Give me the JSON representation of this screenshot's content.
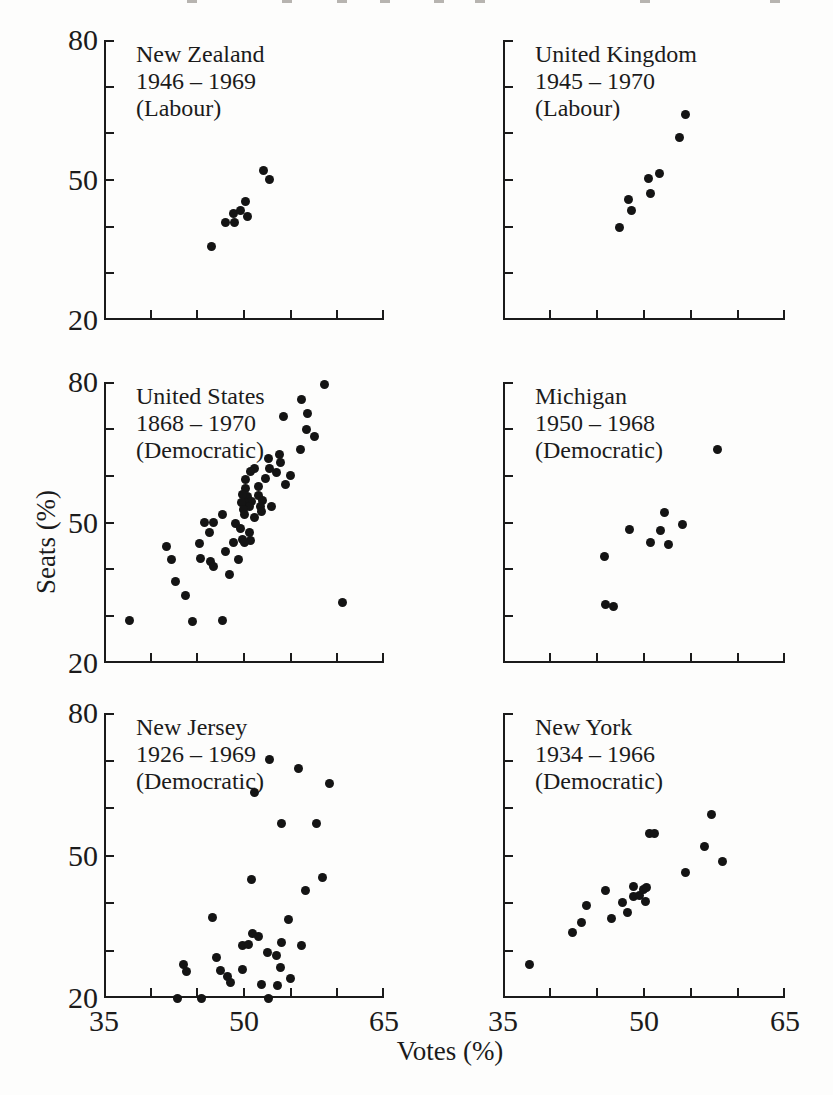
{
  "figure": {
    "xlabel": "Votes (%)",
    "ylabel": "Seats (%)",
    "ink_color": "#1b1b1b",
    "dot_color": "#141414",
    "background": "#fdfdfc",
    "scan_top_edge_marks_x": [
      187,
      282,
      337,
      380,
      434,
      475,
      640,
      770
    ]
  },
  "axes": {
    "xlim": [
      35,
      65
    ],
    "ylim": [
      20,
      80
    ],
    "xticks": [
      40,
      45,
      50,
      55,
      60,
      65
    ],
    "yticks": [
      30,
      40,
      50,
      60,
      70,
      80
    ],
    "xtick_labels": [
      {
        "value": 35,
        "label": "35"
      },
      {
        "value": 50,
        "label": "50"
      },
      {
        "value": 65,
        "label": "65"
      }
    ],
    "ytick_labels": [
      {
        "value": 80,
        "label": "80"
      },
      {
        "value": 50,
        "label": "50"
      },
      {
        "value": 20,
        "label": "20"
      }
    ]
  },
  "chart_data": [
    {
      "type": "scatter",
      "title_lines": [
        "New Zealand",
        "1946 – 1969",
        "(Labour)"
      ],
      "show_y_tick_labels": true,
      "show_x_tick_labels": false,
      "points": [
        [
          46.5,
          35.7
        ],
        [
          48.0,
          40.9
        ],
        [
          48.9,
          42.8
        ],
        [
          49.0,
          40.8
        ],
        [
          49.6,
          43.4
        ],
        [
          50.2,
          45.3
        ],
        [
          50.4,
          42.2
        ],
        [
          52.1,
          52.1
        ],
        [
          52.7,
          50.1
        ]
      ]
    },
    {
      "type": "scatter",
      "title_lines": [
        "United Kingdom",
        "1945 – 1970",
        "(Labour)"
      ],
      "show_y_tick_labels": false,
      "show_x_tick_labels": false,
      "points": [
        [
          47.4,
          39.9
        ],
        [
          48.4,
          45.9
        ],
        [
          48.7,
          43.4
        ],
        [
          50.5,
          50.3
        ],
        [
          50.7,
          47.1
        ],
        [
          51.7,
          51.5
        ],
        [
          53.8,
          59.2
        ],
        [
          54.4,
          64.1
        ]
      ]
    },
    {
      "type": "scatter",
      "title_lines": [
        "United States",
        "1868 – 1970",
        "(Democratic)"
      ],
      "show_y_tick_labels": true,
      "show_x_tick_labels": false,
      "points": [
        [
          58.6,
          79.4
        ],
        [
          56.2,
          76.2
        ],
        [
          56.8,
          73.2
        ],
        [
          54.2,
          72.7
        ],
        [
          56.7,
          69.8
        ],
        [
          57.6,
          68.4
        ],
        [
          56.0,
          65.5
        ],
        [
          53.8,
          64.5
        ],
        [
          53.9,
          62.8
        ],
        [
          52.6,
          63.6
        ],
        [
          52.7,
          61.6
        ],
        [
          53.5,
          60.6
        ],
        [
          51.1,
          61.6
        ],
        [
          52.3,
          59.5
        ],
        [
          54.4,
          58.1
        ],
        [
          55.0,
          60.0
        ],
        [
          50.2,
          59.1
        ],
        [
          50.7,
          60.9
        ],
        [
          51.5,
          57.7
        ],
        [
          51.6,
          55.8
        ],
        [
          50.2,
          57.2
        ],
        [
          50.4,
          55.6
        ],
        [
          49.8,
          55.9
        ],
        [
          50.8,
          54.5
        ],
        [
          50.1,
          54.2
        ],
        [
          50.6,
          53.5
        ],
        [
          49.7,
          54.3
        ],
        [
          49.9,
          52.7
        ],
        [
          52.0,
          54.7
        ],
        [
          51.8,
          53.5
        ],
        [
          51.9,
          52.4
        ],
        [
          52.9,
          53.5
        ],
        [
          50.1,
          51.7
        ],
        [
          51.1,
          51.0
        ],
        [
          47.7,
          51.7
        ],
        [
          45.8,
          49.9
        ],
        [
          46.7,
          49.9
        ],
        [
          46.3,
          47.9
        ],
        [
          49.1,
          49.7
        ],
        [
          49.6,
          48.7
        ],
        [
          49.8,
          46.3
        ],
        [
          50.6,
          47.8
        ],
        [
          50.7,
          46.2
        ],
        [
          50.0,
          45.8
        ],
        [
          48.9,
          45.8
        ],
        [
          45.2,
          45.6
        ],
        [
          41.7,
          44.9
        ],
        [
          42.2,
          42.1
        ],
        [
          45.3,
          42.4
        ],
        [
          48.0,
          43.8
        ],
        [
          46.4,
          41.6
        ],
        [
          49.4,
          42.1
        ],
        [
          46.7,
          40.6
        ],
        [
          48.4,
          38.9
        ],
        [
          42.7,
          37.4
        ],
        [
          43.7,
          34.4
        ],
        [
          60.5,
          33.0
        ],
        [
          37.7,
          29.1
        ],
        [
          44.5,
          28.8
        ],
        [
          47.7,
          29.1
        ]
      ]
    },
    {
      "type": "scatter",
      "title_lines": [
        "Michigan",
        "1950 – 1968",
        "(Democratic)"
      ],
      "show_y_tick_labels": false,
      "show_x_tick_labels": false,
      "points": [
        [
          57.8,
          65.5
        ],
        [
          52.2,
          52.1
        ],
        [
          54.1,
          49.6
        ],
        [
          48.5,
          48.6
        ],
        [
          51.8,
          48.3
        ],
        [
          50.7,
          45.8
        ],
        [
          52.6,
          45.4
        ],
        [
          45.8,
          42.8
        ],
        [
          45.9,
          32.4
        ],
        [
          46.8,
          32.0
        ]
      ]
    },
    {
      "type": "scatter",
      "title_lines": [
        "New Jersey",
        "1926 – 1969",
        "(Democratic)"
      ],
      "show_y_tick_labels": true,
      "show_x_tick_labels": true,
      "points": [
        [
          52.7,
          70.2
        ],
        [
          55.8,
          68.4
        ],
        [
          59.2,
          65.1
        ],
        [
          51.1,
          63.3
        ],
        [
          54.0,
          56.7
        ],
        [
          57.8,
          56.7
        ],
        [
          50.8,
          44.9
        ],
        [
          58.4,
          45.3
        ],
        [
          56.6,
          42.7
        ],
        [
          46.6,
          37.0
        ],
        [
          54.8,
          36.6
        ],
        [
          50.9,
          33.5
        ],
        [
          51.6,
          33.0
        ],
        [
          49.8,
          31.1
        ],
        [
          50.5,
          31.2
        ],
        [
          54.0,
          31.7
        ],
        [
          56.2,
          31.0
        ],
        [
          52.5,
          29.5
        ],
        [
          53.5,
          29.0
        ],
        [
          47.0,
          28.6
        ],
        [
          43.5,
          27.0
        ],
        [
          53.9,
          26.5
        ],
        [
          43.8,
          25.5
        ],
        [
          49.8,
          26.0
        ],
        [
          47.5,
          25.8
        ],
        [
          48.2,
          24.6
        ],
        [
          48.6,
          23.2
        ],
        [
          55.0,
          24.2
        ],
        [
          51.9,
          22.9
        ],
        [
          53.6,
          22.7
        ],
        [
          42.9,
          19.8
        ],
        [
          45.4,
          19.8
        ],
        [
          52.6,
          19.8
        ]
      ]
    },
    {
      "type": "scatter",
      "title_lines": [
        "New York",
        "1934 – 1966",
        "(Democratic)"
      ],
      "show_y_tick_labels": false,
      "show_x_tick_labels": true,
      "points": [
        [
          37.8,
          27.0
        ],
        [
          42.4,
          33.7
        ],
        [
          43.4,
          35.8
        ],
        [
          43.9,
          39.4
        ],
        [
          46.5,
          36.7
        ],
        [
          45.9,
          42.6
        ],
        [
          47.7,
          40.1
        ],
        [
          48.2,
          37.9
        ],
        [
          48.9,
          41.4
        ],
        [
          48.9,
          43.4
        ],
        [
          49.5,
          41.5
        ],
        [
          49.9,
          42.8
        ],
        [
          50.3,
          43.2
        ],
        [
          50.2,
          40.4
        ],
        [
          50.6,
          54.6
        ],
        [
          51.1,
          54.7
        ],
        [
          54.4,
          46.5
        ],
        [
          56.4,
          51.8
        ],
        [
          57.2,
          58.6
        ],
        [
          58.3,
          48.8
        ]
      ]
    }
  ]
}
